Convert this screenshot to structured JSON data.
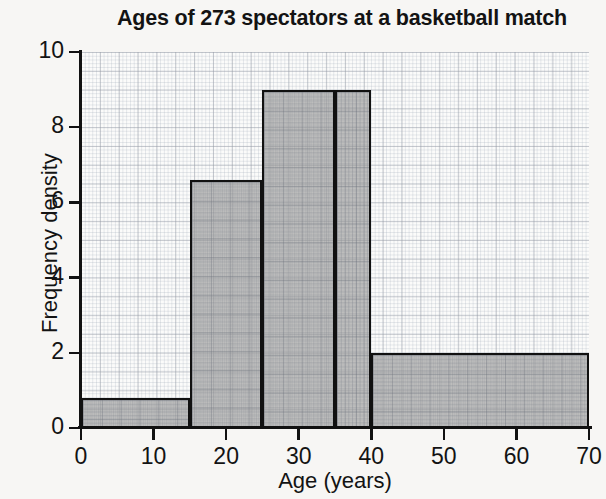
{
  "chart_data": {
    "type": "bar",
    "title": "Ages of 273 spectators at a basketball match",
    "xlabel": "Age (years)",
    "ylabel": "Frequency density",
    "xlim": [
      0,
      70
    ],
    "ylim": [
      0,
      10
    ],
    "xticks": [
      0,
      10,
      20,
      30,
      40,
      50,
      60,
      70
    ],
    "yticks": [
      0,
      2,
      4,
      6,
      8,
      10
    ],
    "grid": true,
    "legend": "none",
    "bar_style": {
      "fill_color": "#969696",
      "edge_color": "#111111",
      "plot_background": "#fbfbfa",
      "page_background": "#f7f6f4"
    },
    "bins": [
      {
        "label": "0-15",
        "start": 0,
        "end": 15,
        "value": 0.8,
        "frequency": 12
      },
      {
        "label": "15-25",
        "start": 15,
        "end": 25,
        "value": 6.6,
        "frequency": 66
      },
      {
        "label": "25-35",
        "start": 25,
        "end": 35,
        "value": 9,
        "frequency": 90
      },
      {
        "label": "35-40",
        "start": 35,
        "end": 40,
        "value": 9,
        "frequency": 45
      },
      {
        "label": "40-70",
        "start": 40,
        "end": 70,
        "value": 2,
        "frequency": 60
      }
    ],
    "categories": [
      "0-15",
      "15-25",
      "25-35",
      "35-40",
      "40-70"
    ],
    "values": [
      0.8,
      6.6,
      9,
      9,
      2
    ],
    "total_frequency": 273
  }
}
